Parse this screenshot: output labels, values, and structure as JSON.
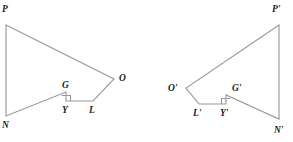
{
  "diagram": {
    "type": "geometry-figure-pair",
    "background_color": "#ffffff",
    "stroke_color": "#9a9a9a",
    "label_color": "#1a1a1a",
    "figures": [
      {
        "name": "figure-left",
        "id": "original",
        "vertices": [
          {
            "label": "P",
            "x": 6,
            "y": 25,
            "label_x": 2,
            "label_y": 12
          },
          {
            "label": "O",
            "x": 114,
            "y": 79,
            "label_x": 119,
            "label_y": 81
          },
          {
            "label": "L",
            "x": 93,
            "y": 101,
            "label_x": 89,
            "label_y": 113
          },
          {
            "label": "Y",
            "x": 66,
            "y": 101,
            "label_x": 62,
            "label_y": 113
          },
          {
            "label": "G",
            "x": 66,
            "y": 92,
            "label_x": 62,
            "label_y": 88
          },
          {
            "label": "N",
            "x": 6,
            "y": 116,
            "label_x": 2,
            "label_y": 128
          }
        ],
        "path": "M 6 25 L 114 79 L 93 101 L 66 101 L 66 92 L 6 116 Z",
        "right_angle": {
          "at": "Y",
          "mark_path": "M 61.5 95.5 L 70.5 95.5 L 70.5 101"
        }
      },
      {
        "name": "figure-right",
        "id": "image",
        "vertices": [
          {
            "label": "P'",
            "x": 279,
            "y": 25,
            "label_x": 272,
            "label_y": 12
          },
          {
            "label": "O'",
            "x": 186,
            "y": 88,
            "label_x": 168,
            "label_y": 91
          },
          {
            "label": "L'",
            "x": 199,
            "y": 104,
            "label_x": 193,
            "label_y": 116
          },
          {
            "label": "Y'",
            "x": 226,
            "y": 104,
            "label_x": 220,
            "label_y": 116
          },
          {
            "label": "G'",
            "x": 226,
            "y": 95,
            "label_x": 232,
            "label_y": 91
          },
          {
            "label": "N'",
            "x": 279,
            "y": 119,
            "label_x": 274,
            "label_y": 133
          }
        ],
        "path": "M 279 25 L 186 88 L 199 104 L 226 104 L 226 95 L 279 119 Z",
        "right_angle": {
          "at": "Y'",
          "mark_path": "M 230.5 98.5 L 221.5 98.5 L 221.5 104"
        }
      }
    ]
  }
}
